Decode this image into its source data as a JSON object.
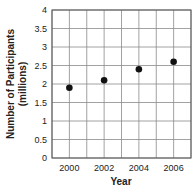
{
  "chart_data": {
    "type": "scatter",
    "title": "",
    "xlabel": "Year",
    "ylabel": "Number of Participants",
    "ylabel_units": "(millions)",
    "x": [
      2000,
      2002,
      2004,
      2006
    ],
    "y": [
      1.9,
      2.1,
      2.4,
      2.6
    ],
    "series": [
      {
        "name": "Participants",
        "x": [
          2000,
          2002,
          2004,
          2006
        ],
        "values": [
          1.9,
          2.1,
          2.4,
          2.6
        ]
      }
    ],
    "xlim": [
      1999,
      2007
    ],
    "ylim": [
      0,
      4
    ],
    "xticks": [
      "2000",
      "2002",
      "2004",
      "2006"
    ],
    "yticks": [
      "0",
      "0.5",
      "1",
      "1.5",
      "2",
      "2.5",
      "3",
      "3.5",
      "4"
    ],
    "grid": true,
    "legend": null,
    "marker_color": "#111111",
    "grid_color": "#8a8a8a"
  }
}
